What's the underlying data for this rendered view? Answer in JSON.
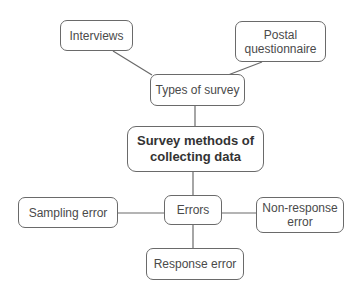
{
  "diagram": {
    "type": "mind-map",
    "central": {
      "label": "Survey methods of\ncollecting data"
    },
    "branches": {
      "types": {
        "label": "Types of survey",
        "children": [
          {
            "label": "Interviews"
          },
          {
            "label": "Postal\nquestionnaire"
          }
        ]
      },
      "errors": {
        "label": "Errors",
        "children": [
          {
            "label": "Sampling error"
          },
          {
            "label": "Non-response\nerror"
          },
          {
            "label": "Response error"
          }
        ]
      }
    },
    "colors": {
      "line": "#6a6a6a",
      "border": "#6a6a6a",
      "text": "#4a4a4a",
      "background": "#ffffff"
    }
  }
}
